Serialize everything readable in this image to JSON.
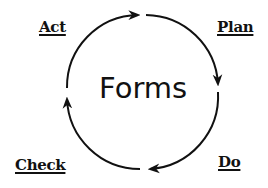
{
  "diagram": {
    "type": "cycle",
    "center_title": "Forms",
    "stages": [
      {
        "label": "Plan",
        "position": "top-right"
      },
      {
        "label": "Do",
        "position": "bottom-right"
      },
      {
        "label": "Check",
        "position": "bottom-left"
      },
      {
        "label": "Act",
        "position": "top-left"
      }
    ],
    "flow_direction": "clockwise",
    "colors": {
      "stroke": "#111111",
      "background": "#ffffff",
      "text": "#111111"
    }
  }
}
